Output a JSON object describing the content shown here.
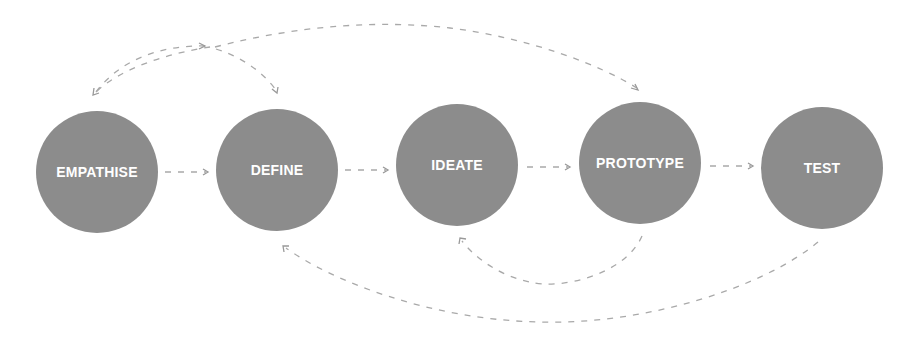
{
  "diagram": {
    "type": "process-flow",
    "colors": {
      "circle_fill": "#8c8c8c",
      "label_text": "#ffffff",
      "arrow_stroke": "#a9a9a9",
      "background": "#ffffff"
    },
    "stages": [
      {
        "id": "empathise",
        "label": "EMPATHISE",
        "cx": 97,
        "cy": 172,
        "r": 61
      },
      {
        "id": "define",
        "label": "DEFINE",
        "cx": 277,
        "cy": 170,
        "r": 61
      },
      {
        "id": "ideate",
        "label": "IDEATE",
        "cx": 457,
        "cy": 165,
        "r": 61
      },
      {
        "id": "prototype",
        "label": "PROTOTYPE",
        "cx": 640,
        "cy": 163,
        "r": 61
      },
      {
        "id": "test",
        "label": "TEST",
        "cx": 822,
        "cy": 168,
        "r": 61
      }
    ],
    "connections": [
      {
        "from": "EMPATHISE",
        "to": "DEFINE",
        "style": "dashed",
        "route": "straight"
      },
      {
        "from": "DEFINE",
        "to": "IDEATE",
        "style": "dashed",
        "route": "straight"
      },
      {
        "from": "IDEATE",
        "to": "PROTOTYPE",
        "style": "dashed",
        "route": "straight"
      },
      {
        "from": "PROTOTYPE",
        "to": "TEST",
        "style": "dashed",
        "route": "straight"
      },
      {
        "from": "PROTOTYPE",
        "to": "IDEATE",
        "style": "dashed",
        "route": "curve-below"
      },
      {
        "from": "TEST",
        "to": "DEFINE",
        "style": "dashed",
        "route": "curve-below"
      },
      {
        "from": "PROTOTYPE",
        "to": "EMPATHISE",
        "style": "dashed",
        "route": "curve-above"
      },
      {
        "from": "EMPATHISE",
        "to": "DEFINE",
        "style": "dashed",
        "route": "curve-above"
      },
      {
        "from": "DEFINE",
        "to": "PROTOTYPE",
        "style": "dashed",
        "route": "curve-above"
      }
    ]
  }
}
